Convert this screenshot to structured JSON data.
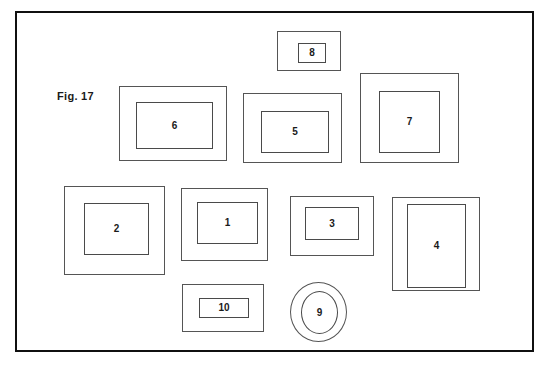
{
  "figure": {
    "label": "Fig. 17",
    "caption_text": "Fig. 17",
    "frame_color": "#101010",
    "part_outline_color": "#555555",
    "background_color": "#ffffff",
    "width": 549,
    "height": 365
  },
  "parts": [
    {
      "number": "8",
      "shape": "rectangle",
      "outer": {
        "x": 277,
        "y": 31,
        "w": 64,
        "h": 40
      },
      "inner": {
        "x": 20,
        "y": 11,
        "w": 28,
        "h": 20
      }
    },
    {
      "number": "6",
      "shape": "rectangle",
      "outer": {
        "x": 119,
        "y": 86,
        "w": 108,
        "h": 75
      },
      "inner": {
        "x": 16,
        "y": 15,
        "w": 77,
        "h": 47
      }
    },
    {
      "number": "5",
      "shape": "rectangle",
      "outer": {
        "x": 243,
        "y": 93,
        "w": 99,
        "h": 70
      },
      "inner": {
        "x": 17,
        "y": 17,
        "w": 68,
        "h": 42
      }
    },
    {
      "number": "7",
      "shape": "rectangle",
      "outer": {
        "x": 360,
        "y": 73,
        "w": 99,
        "h": 90
      },
      "inner": {
        "x": 18,
        "y": 17,
        "w": 61,
        "h": 62
      }
    },
    {
      "number": "2",
      "shape": "rectangle",
      "outer": {
        "x": 64,
        "y": 186,
        "w": 101,
        "h": 89
      },
      "inner": {
        "x": 19,
        "y": 16,
        "w": 65,
        "h": 52
      }
    },
    {
      "number": "1",
      "shape": "rectangle",
      "outer": {
        "x": 181,
        "y": 188,
        "w": 87,
        "h": 73
      },
      "inner": {
        "x": 15,
        "y": 13,
        "w": 61,
        "h": 42
      }
    },
    {
      "number": "3",
      "shape": "rectangle",
      "outer": {
        "x": 290,
        "y": 196,
        "w": 84,
        "h": 60
      },
      "inner": {
        "x": 14,
        "y": 10,
        "w": 54,
        "h": 33
      }
    },
    {
      "number": "4",
      "shape": "rectangle",
      "outer": {
        "x": 392,
        "y": 197,
        "w": 88,
        "h": 94
      },
      "inner": {
        "x": 14,
        "y": 6,
        "w": 59,
        "h": 84
      }
    },
    {
      "number": "10",
      "shape": "rectangle",
      "outer": {
        "x": 182,
        "y": 284,
        "w": 82,
        "h": 48
      },
      "inner": {
        "x": 16,
        "y": 13,
        "w": 50,
        "h": 20
      }
    },
    {
      "number": "9",
      "shape": "oval",
      "outer": {
        "x": 290,
        "y": 282,
        "w": 57,
        "h": 60
      },
      "inner": {
        "x": 10,
        "y": 8,
        "w": 37,
        "h": 43
      }
    }
  ]
}
